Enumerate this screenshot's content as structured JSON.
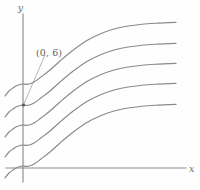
{
  "figure": {
    "background_color": "#fefefe",
    "curve_color": "#8a8a8a",
    "axis_color": "#8c8c8c",
    "label_color": "#5f5f5f",
    "axis_labels": {
      "x": "x",
      "y": "y"
    },
    "annotation": {
      "text": "(0, 6)",
      "label_x": 36,
      "label_y": 47,
      "target_x": 23,
      "target_y": 105
    },
    "axes": {
      "y_axis_x": 23,
      "y_axis_top": 14,
      "y_axis_bottom": 182,
      "x_axis_y": 168,
      "x_axis_left": 6,
      "x_axis_right": 186
    }
  },
  "chart_data": {
    "type": "line",
    "title": "",
    "xlabel": "x",
    "ylabel": "y",
    "grid": false,
    "legend": null,
    "annotations": [
      {
        "text": "(0, 6)",
        "x": 0,
        "y": 6,
        "points_to_curve_index": 1
      }
    ],
    "axis_pixel_ranges": {
      "x": [
        6,
        186
      ],
      "y": [
        14,
        182
      ]
    },
    "y_intercepts_pixels": [
      84,
      105,
      125,
      145,
      166
    ],
    "series": [
      {
        "name": "curve-1",
        "points": [
          [
            5,
            96
          ],
          [
            9,
            91
          ],
          [
            13,
            88
          ],
          [
            17,
            85.5
          ],
          [
            21,
            84.3
          ],
          [
            23,
            84
          ],
          [
            28,
            84.3
          ],
          [
            34,
            82
          ],
          [
            41,
            77
          ],
          [
            50,
            70
          ],
          [
            60,
            61
          ],
          [
            72,
            51
          ],
          [
            86,
            41
          ],
          [
            100,
            34
          ],
          [
            114,
            29
          ],
          [
            128,
            26
          ],
          [
            142,
            24.2
          ],
          [
            156,
            23.2
          ],
          [
            170,
            22.6
          ],
          [
            176,
            22.4
          ]
        ]
      },
      {
        "name": "curve-2",
        "points": [
          [
            5,
            117
          ],
          [
            9,
            112
          ],
          [
            13,
            109
          ],
          [
            17,
            106.5
          ],
          [
            21,
            105.3
          ],
          [
            23,
            105
          ],
          [
            28,
            105.3
          ],
          [
            34,
            103
          ],
          [
            41,
            98
          ],
          [
            50,
            91
          ],
          [
            60,
            82
          ],
          [
            72,
            72
          ],
          [
            86,
            62
          ],
          [
            100,
            55
          ],
          [
            114,
            50
          ],
          [
            128,
            47
          ],
          [
            142,
            45.2
          ],
          [
            156,
            44.2
          ],
          [
            170,
            43.6
          ],
          [
            176,
            43.4
          ]
        ]
      },
      {
        "name": "curve-3",
        "points": [
          [
            5,
            137
          ],
          [
            9,
            132
          ],
          [
            13,
            129
          ],
          [
            17,
            126.5
          ],
          [
            21,
            125.3
          ],
          [
            23,
            125
          ],
          [
            28,
            125.3
          ],
          [
            34,
            123
          ],
          [
            41,
            118
          ],
          [
            50,
            111
          ],
          [
            60,
            102
          ],
          [
            72,
            92
          ],
          [
            86,
            82
          ],
          [
            100,
            75
          ],
          [
            114,
            70
          ],
          [
            128,
            67
          ],
          [
            142,
            65.2
          ],
          [
            156,
            64.2
          ],
          [
            170,
            63.6
          ],
          [
            176,
            63.4
          ]
        ]
      },
      {
        "name": "curve-4",
        "points": [
          [
            5,
            157
          ],
          [
            9,
            152
          ],
          [
            13,
            149
          ],
          [
            17,
            146.5
          ],
          [
            21,
            145.3
          ],
          [
            23,
            145
          ],
          [
            28,
            145.3
          ],
          [
            34,
            143
          ],
          [
            41,
            138
          ],
          [
            50,
            131
          ],
          [
            60,
            122
          ],
          [
            72,
            112
          ],
          [
            86,
            102
          ],
          [
            100,
            95
          ],
          [
            114,
            90
          ],
          [
            128,
            87
          ],
          [
            142,
            85.2
          ],
          [
            156,
            84.2
          ],
          [
            170,
            83.6
          ],
          [
            176,
            83.4
          ]
        ]
      },
      {
        "name": "curve-5",
        "points": [
          [
            5,
            178
          ],
          [
            9,
            173
          ],
          [
            13,
            170
          ],
          [
            17,
            167.5
          ],
          [
            21,
            166.3
          ],
          [
            23,
            166
          ],
          [
            28,
            166.3
          ],
          [
            34,
            164
          ],
          [
            41,
            159
          ],
          [
            50,
            152
          ],
          [
            60,
            143
          ],
          [
            72,
            133
          ],
          [
            86,
            123
          ],
          [
            100,
            116
          ],
          [
            114,
            111
          ],
          [
            128,
            108
          ],
          [
            142,
            106.2
          ],
          [
            156,
            105.2
          ],
          [
            170,
            104.6
          ],
          [
            176,
            104.4
          ]
        ]
      }
    ]
  }
}
